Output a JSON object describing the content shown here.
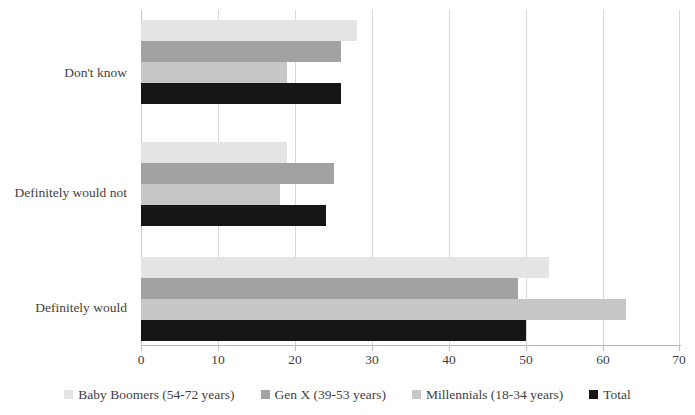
{
  "chart_data": {
    "type": "bar",
    "orientation": "horizontal",
    "title": "",
    "subtitle": "",
    "xlabel": "",
    "ylabel": "",
    "xlim": [
      0,
      70
    ],
    "xticks": [
      0,
      10,
      20,
      30,
      40,
      50,
      60,
      70
    ],
    "grid": true,
    "legend_position": "bottom",
    "categories": [
      "Definitely would",
      "Definitely would not",
      "Don't know"
    ],
    "series": [
      {
        "name": "Baby Boomers (54-72 years)",
        "color": "#e4e4e4",
        "values": [
          53,
          19,
          28
        ]
      },
      {
        "name": "Gen X (39-53 years)",
        "color": "#a2a2a2",
        "values": [
          49,
          25,
          26
        ]
      },
      {
        "name": "Millennials (18-34 years)",
        "color": "#c7c7c7",
        "values": [
          63,
          18,
          19
        ]
      },
      {
        "name": "Total",
        "color": "#161616",
        "values": [
          50,
          24,
          26
        ]
      }
    ]
  }
}
